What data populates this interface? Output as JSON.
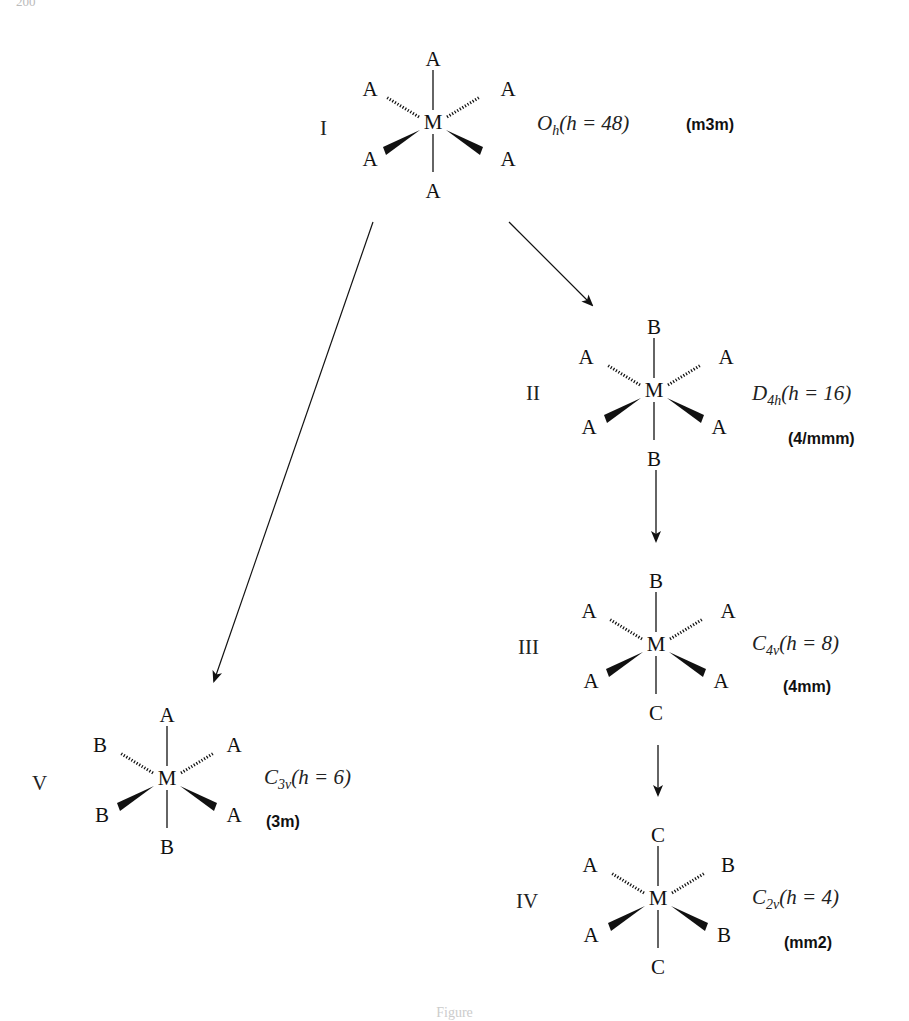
{
  "page": {
    "number": "200"
  },
  "arrow_colors": {
    "stroke": "#111111"
  },
  "structures": [
    {
      "id": "I",
      "roman": "I",
      "center": "M",
      "ligands": {
        "top": "A",
        "bottom": "A",
        "upper_left": "A",
        "upper_right": "A",
        "lower_left": "A",
        "lower_right": "A"
      },
      "point_group": {
        "letter": "O",
        "subscript": "h",
        "order_label": "(h = 48)"
      },
      "hermann_mauguin": "(m3m)"
    },
    {
      "id": "II",
      "roman": "II",
      "center": "M",
      "ligands": {
        "top": "B",
        "bottom": "B",
        "upper_left": "A",
        "upper_right": "A",
        "lower_left": "A",
        "lower_right": "A"
      },
      "point_group": {
        "letter": "D",
        "subscript": "4h",
        "order_label": "(h = 16)"
      },
      "hermann_mauguin": "(4/mmm)"
    },
    {
      "id": "III",
      "roman": "III",
      "center": "M",
      "ligands": {
        "top": "B",
        "bottom": "C",
        "upper_left": "A",
        "upper_right": "A",
        "lower_left": "A",
        "lower_right": "A"
      },
      "point_group": {
        "letter": "C",
        "subscript": "4v",
        "order_label": "(h = 8)"
      },
      "hermann_mauguin": "(4mm)"
    },
    {
      "id": "IV",
      "roman": "IV",
      "center": "M",
      "ligands": {
        "top": "C",
        "bottom": "C",
        "upper_left": "A",
        "upper_right": "B",
        "lower_left": "A",
        "lower_right": "B"
      },
      "point_group": {
        "letter": "C",
        "subscript": "2v",
        "order_label": "(h = 4)"
      },
      "hermann_mauguin": "(mm2)"
    },
    {
      "id": "V",
      "roman": "V",
      "center": "M",
      "ligands": {
        "top": "A",
        "bottom": "B",
        "upper_left": "B",
        "upper_right": "A",
        "lower_left": "B",
        "lower_right": "A"
      },
      "point_group": {
        "letter": "C",
        "subscript": "3v",
        "order_label": "(h = 6)"
      },
      "hermann_mauguin": "(3m)"
    }
  ],
  "arrows": [
    {
      "from": "I",
      "to": "II"
    },
    {
      "from": "II",
      "to": "III"
    },
    {
      "from": "III",
      "to": "IV"
    },
    {
      "from": "I",
      "to": "V"
    }
  ],
  "caption": "Figure"
}
